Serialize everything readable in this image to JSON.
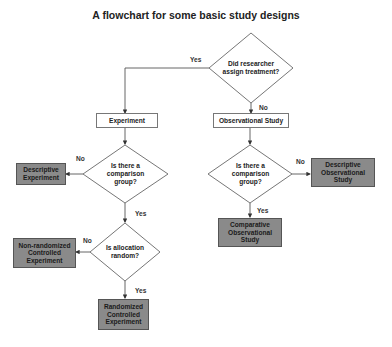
{
  "title": "A flowchart for some basic study designs",
  "nodes": {
    "q_assign": "Did researcher assign treatment?",
    "experiment": "Experiment",
    "observational": "Observational Study",
    "q_comp_exp": "Is there a comparison group?",
    "q_comp_obs": "Is there a comparison group?",
    "q_random": "Is allocation random?",
    "desc_exp": "Descriptive Experiment",
    "desc_obs": "Descriptive Observational Study",
    "comp_obs": "Comparative Observational Study",
    "nonrand": "Non-randomized Controlled Experiment",
    "rct": "Randomized Controlled Experiment"
  },
  "edges": {
    "assign_yes": "Yes",
    "assign_no": "No",
    "comp_exp_no": "No",
    "comp_exp_yes": "Yes",
    "comp_obs_no": "No",
    "comp_obs_yes": "Yes",
    "random_no": "No",
    "random_yes": "Yes"
  },
  "colors": {
    "outcome_fill": "#8a8a8a",
    "line": "#555555"
  }
}
